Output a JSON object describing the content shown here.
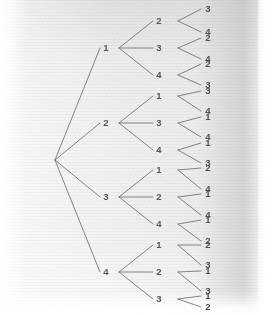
{
  "diagram": {
    "type": "tree",
    "root": {
      "label": "",
      "x": 55,
      "y": 160
    },
    "geometry": {
      "level1_label_x": 106,
      "level1_vertex_x": 119,
      "level2_label_x": 159,
      "level2_vertex_x": 170,
      "leaf_label_x": 208,
      "leaf_line_start_x": 178,
      "leaf_line_end_x": 201
    },
    "line_color": "#6f6f72",
    "text_color": "#55565a",
    "branches": [
      {
        "label": "1",
        "y": 48,
        "children": [
          {
            "label": "2",
            "y": 21,
            "leaves": [
              {
                "label": "3",
                "y": 9
              },
              {
                "label": "4",
                "y": 32
              }
            ]
          },
          {
            "label": "3",
            "y": 48,
            "leaves": [
              {
                "label": "2",
                "y": 38
              },
              {
                "label": "4",
                "y": 59
              }
            ]
          },
          {
            "label": "4",
            "y": 75,
            "leaves": [
              {
                "label": "2",
                "y": 64
              },
              {
                "label": "3",
                "y": 85
              }
            ]
          }
        ]
      },
      {
        "label": "2",
        "y": 123,
        "children": [
          {
            "label": "1",
            "y": 96,
            "leaves": [
              {
                "label": "3",
                "y": 91
              },
              {
                "label": "4",
                "y": 111
              }
            ]
          },
          {
            "label": "3",
            "y": 123,
            "leaves": [
              {
                "label": "1",
                "y": 117
              },
              {
                "label": "4",
                "y": 137
              }
            ]
          },
          {
            "label": "4",
            "y": 150,
            "leaves": [
              {
                "label": "1",
                "y": 143
              },
              {
                "label": "3",
                "y": 163
              }
            ]
          }
        ]
      },
      {
        "label": "3",
        "y": 197,
        "children": [
          {
            "label": "1",
            "y": 170,
            "leaves": [
              {
                "label": "2",
                "y": 168
              },
              {
                "label": "4",
                "y": 189
              }
            ]
          },
          {
            "label": "2",
            "y": 197,
            "leaves": [
              {
                "label": "1",
                "y": 194
              },
              {
                "label": "4",
                "y": 215
              }
            ]
          },
          {
            "label": "4",
            "y": 224,
            "leaves": [
              {
                "label": "1",
                "y": 220
              },
              {
                "label": "2",
                "y": 241
              }
            ]
          }
        ]
      },
      {
        "label": "4",
        "y": 272,
        "children": [
          {
            "label": "1",
            "y": 245,
            "leaves": [
              {
                "label": "2",
                "y": 245
              },
              {
                "label": "3",
                "y": 265
              }
            ]
          },
          {
            "label": "2",
            "y": 272,
            "leaves": [
              {
                "label": "1",
                "y": 271
              },
              {
                "label": "3",
                "y": 291
              }
            ]
          },
          {
            "label": "3",
            "y": 299,
            "leaves": [
              {
                "label": "1",
                "y": 296
              },
              {
                "label": "2",
                "y": 307
              }
            ]
          }
        ]
      }
    ]
  }
}
